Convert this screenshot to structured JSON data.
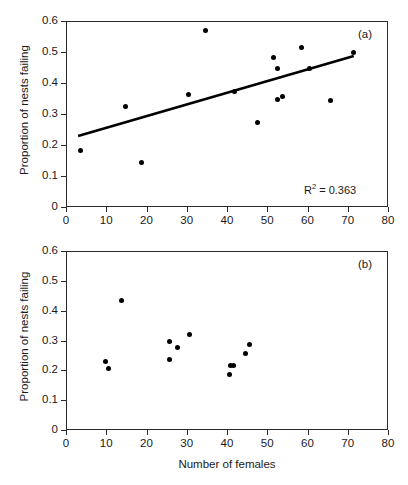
{
  "figure": {
    "x_axis_title": "Number of females",
    "panels": [
      {
        "tag": "(a)",
        "y_axis_title": "Proportion of nests failing"
      },
      {
        "tag": "(b)",
        "y_axis_title": "Proportion of nests failing"
      }
    ]
  },
  "chart_data": [
    {
      "type": "scatter",
      "title": "",
      "panel_label": "(a)",
      "xlabel": "Number of females",
      "ylabel": "Proportion of nests failing",
      "xlim": [
        0,
        80
      ],
      "ylim": [
        0,
        0.6
      ],
      "xticks": [
        0,
        10,
        20,
        30,
        40,
        50,
        60,
        70,
        80
      ],
      "yticks": [
        0,
        0.1,
        0.2,
        0.3,
        0.4,
        0.5,
        0.6
      ],
      "xtick_labels": [
        "0",
        "10",
        "20",
        "30",
        "40",
        "50",
        "60",
        "70",
        "80"
      ],
      "ytick_labels": [
        "0",
        "0.1",
        "0.2",
        "0.3",
        "0.4",
        "0.5",
        "0.6"
      ],
      "grid": false,
      "legend": false,
      "marker": "filled-circle",
      "marker_color": "#000000",
      "annotations": [
        {
          "text": "R² = 0.363",
          "r2": 0.363
        }
      ],
      "trendline": {
        "type": "linear",
        "x_start": 3.0,
        "y_start": 0.229,
        "x_end": 71.5,
        "y_end": 0.487,
        "color": "#000000",
        "width": 2.6
      },
      "points": [
        {
          "x": 3.5,
          "y": 0.181
        },
        {
          "x": 14.7,
          "y": 0.324
        },
        {
          "x": 18.8,
          "y": 0.144
        },
        {
          "x": 30.5,
          "y": 0.364
        },
        {
          "x": 34.6,
          "y": 0.569
        },
        {
          "x": 41.8,
          "y": 0.371
        },
        {
          "x": 47.6,
          "y": 0.274
        },
        {
          "x": 51.6,
          "y": 0.482
        },
        {
          "x": 52.5,
          "y": 0.447
        },
        {
          "x": 52.6,
          "y": 0.348
        },
        {
          "x": 53.8,
          "y": 0.356
        },
        {
          "x": 58.6,
          "y": 0.515
        },
        {
          "x": 60.6,
          "y": 0.447
        },
        {
          "x": 65.8,
          "y": 0.343
        },
        {
          "x": 71.5,
          "y": 0.499
        }
      ]
    },
    {
      "type": "scatter",
      "title": "",
      "panel_label": "(b)",
      "xlabel": "Number of females",
      "ylabel": "Proportion of nests failing",
      "xlim": [
        0,
        80
      ],
      "ylim": [
        0,
        0.6
      ],
      "xticks": [
        0,
        10,
        20,
        30,
        40,
        50,
        60,
        70,
        80
      ],
      "yticks": [
        0,
        0.1,
        0.2,
        0.3,
        0.4,
        0.5,
        0.6
      ],
      "xtick_labels": [
        "0",
        "10",
        "20",
        "30",
        "40",
        "50",
        "60",
        "70",
        "80"
      ],
      "ytick_labels": [
        "0",
        "0.1",
        "0.2",
        "0.3",
        "0.4",
        "0.5",
        "0.6"
      ],
      "grid": false,
      "legend": false,
      "marker": "filled-circle",
      "marker_color": "#000000",
      "annotations": [],
      "trendline": null,
      "points": [
        {
          "x": 9.7,
          "y": 0.228
        },
        {
          "x": 10.6,
          "y": 0.207
        },
        {
          "x": 13.8,
          "y": 0.435
        },
        {
          "x": 25.6,
          "y": 0.297
        },
        {
          "x": 25.7,
          "y": 0.237
        },
        {
          "x": 27.7,
          "y": 0.275
        },
        {
          "x": 30.7,
          "y": 0.319
        },
        {
          "x": 40.6,
          "y": 0.187
        },
        {
          "x": 40.8,
          "y": 0.215
        },
        {
          "x": 41.6,
          "y": 0.216
        },
        {
          "x": 44.7,
          "y": 0.257
        },
        {
          "x": 45.6,
          "y": 0.285
        }
      ]
    }
  ]
}
